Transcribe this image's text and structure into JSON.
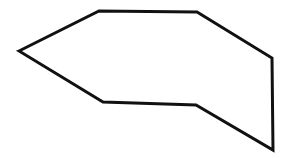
{
  "canvas": {
    "width": 292,
    "height": 158,
    "background_color": "#ffffff"
  },
  "figure": {
    "name": "irregular-heptagon-outline",
    "shape_type": "polygon",
    "vertex_count": 7,
    "closed": true,
    "fill_color": "#ffffff",
    "stroke_color": "#111111",
    "stroke_width": 3,
    "vertices": [
      {
        "label": "left-point",
        "x": 19,
        "y": 51
      },
      {
        "label": "top-left",
        "x": 99,
        "y": 11
      },
      {
        "label": "top-right",
        "x": 197,
        "y": 12
      },
      {
        "label": "right-upper",
        "x": 272,
        "y": 58
      },
      {
        "label": "bottom-right",
        "x": 273,
        "y": 150
      },
      {
        "label": "bottom-middle",
        "x": 196,
        "y": 105
      },
      {
        "label": "bottom-left",
        "x": 103,
        "y": 102
      }
    ],
    "points_attr": "19,51 99,11 197,12 272,58 273,150 196,105 103,102"
  }
}
